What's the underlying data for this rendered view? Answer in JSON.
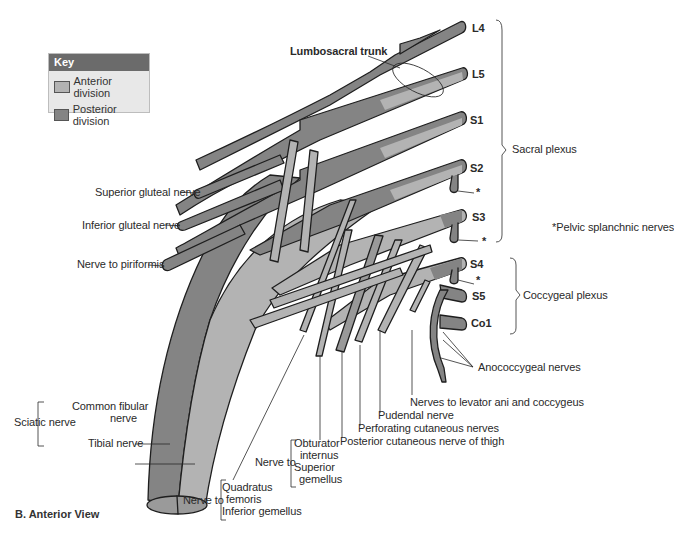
{
  "key": {
    "title": "Key",
    "items": [
      {
        "label": "Anterior division",
        "color": "#b3b3b3"
      },
      {
        "label": "Posterior division",
        "color": "#848484"
      }
    ]
  },
  "roots": [
    "L4",
    "L5",
    "S1",
    "S2",
    "S3",
    "S4",
    "S5",
    "Co1"
  ],
  "labels": {
    "lumbosacral_trunk": "Lumbosacral trunk",
    "sacral_plexus": "Sacral plexus",
    "coccygeal_plexus": "Coccygeal plexus",
    "pelvic_splanchnic": "*Pelvic splanchnic nerves",
    "star": "*",
    "superior_gluteal": "Superior gluteal nerve",
    "inferior_gluteal": "Inferior gluteal nerve",
    "nerve_to_piriformis": "Nerve to piriformis",
    "anococcygeal": "Anococcygeal nerves",
    "levator_ani": "Nerves to levator ani and coccygeus",
    "pudendal": "Pudendal nerve",
    "perforating": "Perforating cutaneous nerves",
    "posterior_cutaneous": "Posterior cutaneous nerve of thigh",
    "nerve_to_1": "Nerve to",
    "obturator_internus_1": "Obturator",
    "obturator_internus_2": "internus",
    "superior_gemellus_1": "Superior",
    "superior_gemellus_2": "gemellus",
    "nerve_to_2": "Nerve to",
    "quadratus_1": "Quadratus",
    "quadratus_2": "femoris",
    "inferior_gemellus": "Inferior gemellus",
    "sciatic": "Sciatic nerve",
    "common_fibular_1": "Common fibular",
    "common_fibular_2": "nerve",
    "tibial": "Tibial nerve"
  },
  "figure_title": "B. Anterior View",
  "colors": {
    "anterior": "#b3b3b3",
    "posterior": "#848484",
    "outline": "#1e1e1e",
    "key_header": "#6b6b6b"
  }
}
